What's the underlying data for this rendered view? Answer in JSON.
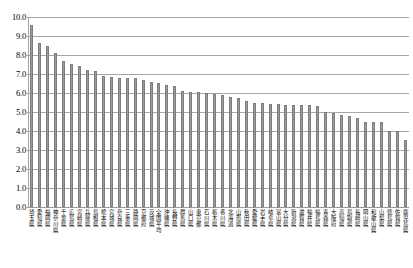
{
  "chart_data": {
    "type": "bar",
    "title": "",
    "subtitle": "",
    "xlabel": "",
    "ylabel": "",
    "ylim": [
      0.0,
      10.0
    ],
    "ytick_step": 1.0,
    "ytick_labels": [
      "10.0",
      "9.0",
      "8.0",
      "7.0",
      "6.0",
      "5.0",
      "4.0",
      "3.0",
      "2.0",
      "1.0",
      "0.0"
    ],
    "grid": true,
    "legend": "none",
    "bar_color": "#9d9d9d",
    "bar_edge_color": "#7d7d7d",
    "gridline_color": "#a6a6a6",
    "categories": [
      "埼玉県",
      "愛知県",
      "福岡県",
      "神奈川県",
      "千葉県",
      "広島県",
      "宮崎県",
      "兵庫県",
      "島根県",
      "熊本県",
      "宮城県",
      "奈良県",
      "三重県",
      "静岡県",
      "京都府",
      "茨城県",
      "全国平均",
      "沖縄県",
      "長野県",
      "群馬県",
      "山口県",
      "東京都",
      "石川県",
      "栃木県",
      "香川県",
      "北海道",
      "山形県",
      "秋田県",
      "愛媛県",
      "岩手県",
      "岐阜県",
      "富山県",
      "大分県",
      "新潟県",
      "滋賀県",
      "福井県",
      "福島県",
      "青森県",
      "大阪府",
      "高知県",
      "鳥取県",
      "長崎県",
      "岡山県",
      "和歌山県",
      "山梨県",
      "徳島県",
      "佐賀県",
      "鹿児島県"
    ],
    "values": [
      9.6,
      8.65,
      8.45,
      8.1,
      7.7,
      7.55,
      7.4,
      7.2,
      7.15,
      6.9,
      6.85,
      6.8,
      6.8,
      6.8,
      6.7,
      6.6,
      6.55,
      6.4,
      6.35,
      6.1,
      6.05,
      6.05,
      6.0,
      5.95,
      5.9,
      5.8,
      5.75,
      5.6,
      5.5,
      5.45,
      5.4,
      5.4,
      5.35,
      5.35,
      5.35,
      5.35,
      5.3,
      5.0,
      4.95,
      4.85,
      4.8,
      4.7,
      4.5,
      4.5,
      4.5,
      4.0,
      4.0,
      3.55
    ]
  },
  "axis": {
    "y_label_0": "0.0",
    "y_label_1": "1.0",
    "y_label_2": "2.0",
    "y_label_3": "3.0",
    "y_label_4": "4.0",
    "y_label_5": "5.0",
    "y_label_6": "6.0",
    "y_label_7": "7.0",
    "y_label_8": "8.0",
    "y_label_9": "9.0",
    "y_label_10": "10.0"
  }
}
